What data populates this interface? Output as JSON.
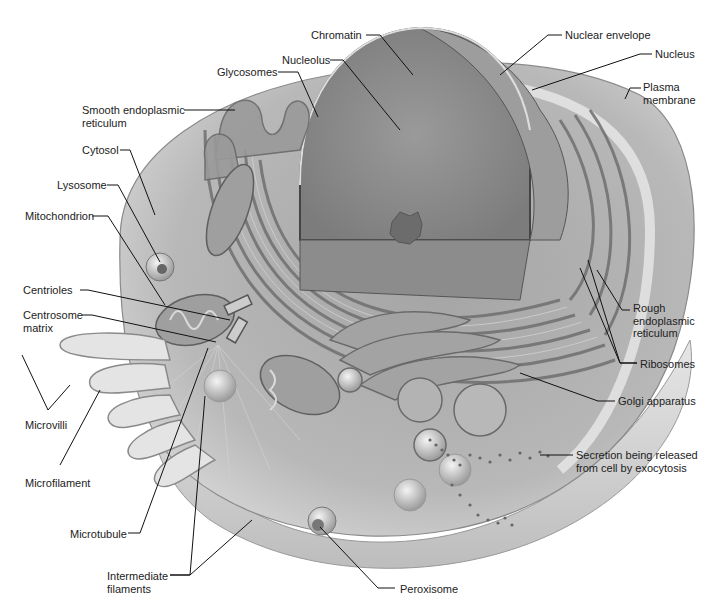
{
  "diagram": {
    "labels": [
      {
        "id": "chromatin",
        "text": "Chromatin",
        "x": 311,
        "y": 30
      },
      {
        "id": "nuclear-envelope",
        "text": "Nuclear envelope",
        "x": 565,
        "y": 30
      },
      {
        "id": "nucleolus",
        "text": "Nucleolus",
        "x": 282,
        "y": 55
      },
      {
        "id": "nucleus",
        "text": "Nucleus",
        "x": 655,
        "y": 49
      },
      {
        "id": "glycosomes",
        "text": "Glycosomes",
        "x": 217,
        "y": 67
      },
      {
        "id": "plasma-membrane",
        "text": "Plasma\nmembrane",
        "x": 643,
        "y": 82
      },
      {
        "id": "smooth-er",
        "text": "Smooth endoplasmic\nreticulum",
        "x": 82,
        "y": 104
      },
      {
        "id": "cytosol",
        "text": "Cytosol",
        "x": 82,
        "y": 144
      },
      {
        "id": "lysosome",
        "text": "Lysosome",
        "x": 57,
        "y": 180
      },
      {
        "id": "mitochondrion",
        "text": "Mitochondrion",
        "x": 25,
        "y": 210
      },
      {
        "id": "centrioles",
        "text": "Centrioles",
        "x": 23,
        "y": 284
      },
      {
        "id": "centrosome-matrix",
        "text": "Centrosome\nmatrix",
        "x": 23,
        "y": 310
      },
      {
        "id": "rough-er",
        "text": "Rough\nendoplasmic\nreticulum",
        "x": 633,
        "y": 302
      },
      {
        "id": "ribosomes",
        "text": "Ribosomes",
        "x": 640,
        "y": 359
      },
      {
        "id": "golgi",
        "text": "Golgi apparatus",
        "x": 618,
        "y": 396
      },
      {
        "id": "microvilli",
        "text": "Microvilli",
        "x": 25,
        "y": 419
      },
      {
        "id": "secretion",
        "text": "Secretion being released\nfrom cell by exocytosis",
        "x": 576,
        "y": 450
      },
      {
        "id": "microfilament",
        "text": "Microfilament",
        "x": 25,
        "y": 477
      },
      {
        "id": "microtubule",
        "text": "Microtubule",
        "x": 70,
        "y": 529
      },
      {
        "id": "intermediate-filaments",
        "text": "Intermediate\nfilaments",
        "x": 107,
        "y": 570
      },
      {
        "id": "peroxisome",
        "text": "Peroxisome",
        "x": 400,
        "y": 584
      }
    ]
  },
  "colors": {
    "background": "#ffffff",
    "leader_line": "#111111",
    "label_text": "#222222",
    "cell_body": "#b9b9b9",
    "cytoplasm": "#9a9a9a",
    "nucleus": "#8a8a8a",
    "membrane_light": "#e2e2e2"
  }
}
